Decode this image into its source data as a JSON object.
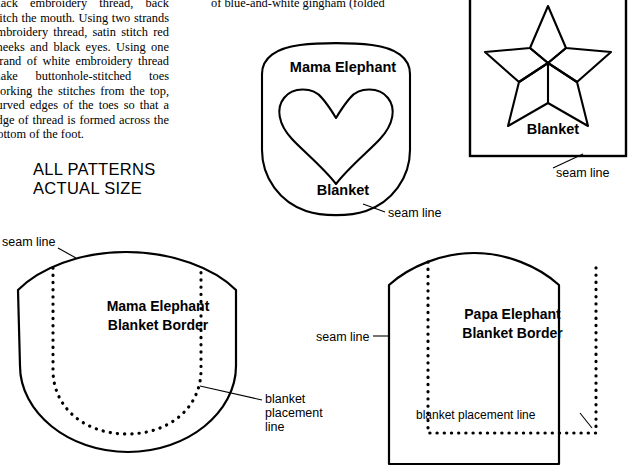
{
  "page": {
    "width": 641,
    "height": 476,
    "background": "#ffffff",
    "ink": "#000000"
  },
  "columns": {
    "left": {
      "name": "instructions-left-column",
      "text": "black embroidery thread, back stitch the mouth. Using two strands embroidery thread, satin stitch red cheeks and black eyes. Using one strand of white embroidery thread make buttonhole-stitched toes working the stitches from the top, curved edges of the toes so that a edge of thread is formed across the bottom of the foot."
    },
    "middle": {
      "name": "instructions-middle-column",
      "text": "of blue-and-white gingham (folded"
    }
  },
  "headline": {
    "text": "ALL PATTERNS\nACTUAL SIZE"
  },
  "patterns": [
    {
      "id": "mama-elephant-blanket",
      "top_label": "Mama Elephant",
      "bottom_label": "Blanket",
      "shape": "shield-with-heart",
      "annotation": "seam line"
    },
    {
      "id": "star-blanket",
      "bottom_label": "Blanket",
      "shape": "five-point-star-in-box",
      "annotation": "seam line"
    },
    {
      "id": "mama-elephant-blanket-border",
      "label": "Mama Elephant\nBlanket Border",
      "shape": "rounded-border-piece",
      "annotations": [
        "seam line",
        "blanket\nplacement\nline"
      ]
    },
    {
      "id": "papa-elephant-blanket-border",
      "label": "Papa Elephant\nBlanket Border",
      "shape": "arched-border-piece",
      "annotations": [
        "seam line",
        "blanket placement line"
      ]
    }
  ],
  "annotations": {
    "seam_line_star": "seam line",
    "seam_line_mama_blanket": "seam line",
    "seam_line_top_left": "seam line",
    "seam_line_papa": "seam line",
    "blanket_placement_line_mama": "blanket\nplacement\nline",
    "blanket_placement_line_papa": "blanket placement line"
  }
}
